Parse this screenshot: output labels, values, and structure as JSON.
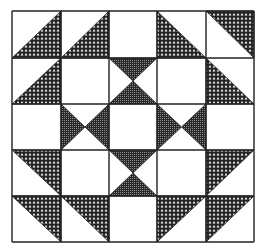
{
  "figure": {
    "type": "quilt-block-pattern",
    "grid": {
      "rows": 5,
      "cols": 5
    },
    "colors": {
      "background": "#ffffff",
      "line": "#222222",
      "dot_fill": "#222222",
      "cross_fill": "#2a2a2a"
    },
    "cells": [
      [
        "tri-lower-right",
        "tri-lower-right",
        "blank",
        "tri-lower-left",
        "tri-upper-right"
      ],
      [
        "tri-lower-right",
        "blank",
        "hourglass",
        "blank",
        "tri-lower-left"
      ],
      [
        "blank",
        "bowtie",
        "blank",
        "bowtie",
        "blank"
      ],
      [
        "tri-upper-right",
        "blank",
        "hourglass",
        "blank",
        "tri-upper-left"
      ],
      [
        "tri-upper-right",
        "tri-upper-right",
        "blank",
        "tri-upper-left",
        "tri-upper-left"
      ]
    ]
  }
}
